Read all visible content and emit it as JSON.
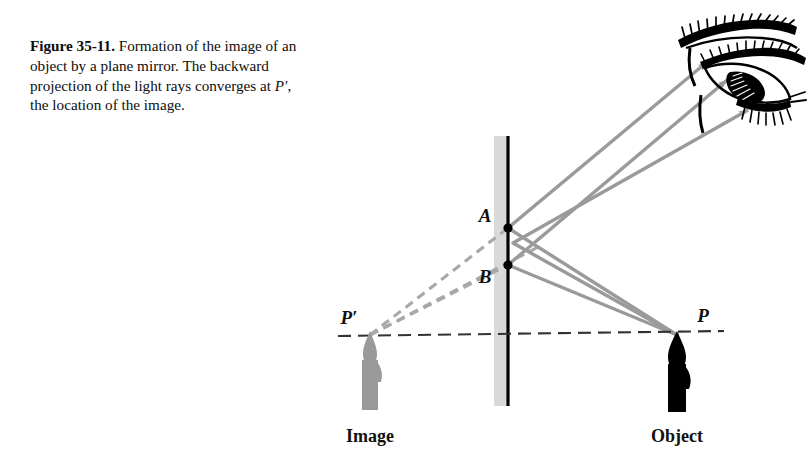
{
  "figure": {
    "number_label": "Figure 35-11.",
    "caption_part1": " Formation of the image of an object by a plane mirror. The backward projection of the light rays converges at ",
    "caption_point": "P′",
    "caption_part2": ", the location of the image.",
    "caption_full": "Figure 35-11. Formation of the image of an object by a plane mirror. The backward projection of the light rays converges at P′, the location of the image."
  },
  "labels": {
    "point_a": "A",
    "point_b": "B",
    "point_p_prime": "P′",
    "point_p": "P",
    "image_caption": "Image",
    "object_caption": "Object"
  },
  "icons": {
    "eye": "eye-icon",
    "object_candle": "candle-black-icon",
    "image_candle": "candle-gray-icon",
    "mirror": "plane-mirror-icon"
  },
  "colors": {
    "ray": "#9a9a9a",
    "ray_dashed": "#a8a8a8",
    "mirror_surface": "#000000",
    "mirror_glass": "#d9d9d9",
    "object": "#000000",
    "image": "#9a9a9a",
    "axis": "#333333",
    "text": "#0d0d0d",
    "background": "#ffffff"
  },
  "geometry": {
    "mirror_x": 508,
    "mirror_top_y": 136,
    "mirror_bottom_y": 406,
    "glass_width": 14,
    "point_a": [
      508,
      228
    ],
    "point_b": [
      508,
      265
    ],
    "axis_y": 335,
    "axis_x_start": 338,
    "axis_x_end": 724,
    "p_point": [
      677,
      335
    ],
    "p_prime_point": [
      370,
      335
    ],
    "ray_count": 3
  }
}
